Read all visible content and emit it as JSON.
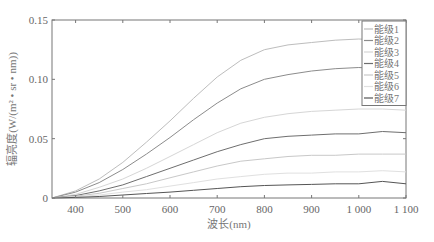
{
  "chart_data": {
    "type": "line",
    "title": "",
    "xlabel": "波长(nm)",
    "ylabel": "辐亮度(W/(m² • sr • nm))",
    "xlim": [
      350,
      1100
    ],
    "ylim": [
      0,
      0.15
    ],
    "x_ticks": [
      400,
      500,
      600,
      700,
      800,
      900,
      1000,
      1100
    ],
    "x_tick_labels": [
      "400",
      "500",
      "600",
      "700",
      "800",
      "900",
      "1 000",
      "1 100"
    ],
    "y_ticks": [
      0,
      0.05,
      0.1,
      0.15
    ],
    "y_tick_labels": [
      "0",
      "0.05",
      "0.10",
      "0.15"
    ],
    "grid": false,
    "legend_position": "upper right",
    "x": [
      350,
      400,
      450,
      500,
      550,
      600,
      650,
      700,
      750,
      800,
      850,
      900,
      950,
      1000,
      1050,
      1100
    ],
    "series": [
      {
        "name": "能级1",
        "color": "#bdbdbd",
        "values": [
          0.0,
          0.006,
          0.016,
          0.03,
          0.047,
          0.065,
          0.084,
          0.102,
          0.116,
          0.125,
          0.129,
          0.131,
          0.133,
          0.134,
          0.133,
          0.132
        ]
      },
      {
        "name": "能级2",
        "color": "#8c8c8c",
        "values": [
          0.0,
          0.005,
          0.013,
          0.024,
          0.037,
          0.051,
          0.066,
          0.08,
          0.092,
          0.1,
          0.104,
          0.107,
          0.109,
          0.11,
          0.109,
          0.108
        ]
      },
      {
        "name": "能级3",
        "color": "#d6d6d6",
        "values": [
          0.0,
          0.003,
          0.009,
          0.016,
          0.025,
          0.035,
          0.045,
          0.055,
          0.063,
          0.068,
          0.071,
          0.073,
          0.074,
          0.075,
          0.075,
          0.074
        ]
      },
      {
        "name": "能级4",
        "color": "#6e6e6e",
        "values": [
          0.0,
          0.002,
          0.006,
          0.011,
          0.018,
          0.025,
          0.032,
          0.039,
          0.045,
          0.05,
          0.052,
          0.053,
          0.054,
          0.054,
          0.056,
          0.055
        ]
      },
      {
        "name": "能级5",
        "color": "#c8c8c8",
        "values": [
          0.0,
          0.0015,
          0.004,
          0.008,
          0.012,
          0.017,
          0.022,
          0.027,
          0.031,
          0.033,
          0.035,
          0.036,
          0.036,
          0.037,
          0.037,
          0.037
        ]
      },
      {
        "name": "能级6",
        "color": "#e0e0e0",
        "values": [
          0.0,
          0.001,
          0.0025,
          0.005,
          0.007,
          0.01,
          0.013,
          0.016,
          0.018,
          0.02,
          0.021,
          0.021,
          0.022,
          0.022,
          0.023,
          0.022
        ]
      },
      {
        "name": "能级7",
        "color": "#555555",
        "values": [
          0.0,
          0.0005,
          0.0013,
          0.0025,
          0.0038,
          0.005,
          0.0065,
          0.008,
          0.0095,
          0.0105,
          0.011,
          0.0115,
          0.012,
          0.012,
          0.014,
          0.012
        ]
      }
    ]
  }
}
